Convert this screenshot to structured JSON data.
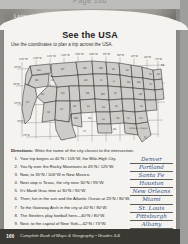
{
  "page": {
    "cutoff_text": "Page 166",
    "header_label": "Latitude and Longitude",
    "title": "See the USA",
    "subtitle": "Use the coordinates to plan a trip across the USA.",
    "directions_label": "Directions:",
    "directions_text": "Write the name of the city closest to the intersection."
  },
  "map": {
    "type": "united-states-political-map",
    "caption_longitude": [
      "125°W",
      "120°W",
      "115°W",
      "110°W",
      "105°W",
      "100°W",
      "95°W",
      "90°W",
      "85°W",
      "80°W",
      "75°W",
      "70°W"
    ],
    "caption_latitude": [
      "45°N",
      "40°N",
      "35°N",
      "30°N",
      "25°N"
    ],
    "labels": [
      "WA",
      "OR",
      "CA",
      "NV",
      "ID",
      "MT",
      "WY",
      "UT",
      "AZ",
      "NM",
      "CO",
      "ND",
      "SD",
      "NE",
      "KS",
      "OK",
      "TX",
      "MN",
      "IA",
      "MO",
      "AR",
      "LA",
      "WI",
      "IL",
      "MI",
      "IN",
      "OH",
      "KY",
      "TN",
      "MS",
      "AL",
      "GA",
      "FL",
      "SC",
      "NC",
      "VA",
      "WV",
      "PA",
      "NY",
      "ME",
      "MD"
    ],
    "ocean_label": "Atlantic Ocean"
  },
  "questions": [
    {
      "num": "1.",
      "text": "Your trip begins at 40°N / 105°W, the Mile-High City.",
      "answer": "Denver"
    },
    {
      "num": "2.",
      "text": "You fly over the Rocky Mountains to 45°N / 125°W.",
      "answer": "Portland"
    },
    {
      "num": "3.",
      "text": "Now, to 35°N / 106°W in New Mexico.",
      "answer": "Santa Fe"
    },
    {
      "num": "4.",
      "text": "Next stop is Texas, the city near 30°N / 95°W.",
      "answer": "Houston"
    },
    {
      "num": "5.",
      "text": "It's Mardi Gras time at 30°N / 90°W.",
      "answer": "New Orleans"
    },
    {
      "num": "6.",
      "text": "Then, fun in the sun and the Atlantic Ocean at 25°N / 80°W.",
      "answer": "Miami"
    },
    {
      "num": "7.",
      "text": "To the Gateway Arch in the city at 40°N / 90°W.",
      "answer": "St. Louis"
    },
    {
      "num": "8.",
      "text": "The Steelers play football here—40°N / 80°W.",
      "answer": "Pittsburgh"
    },
    {
      "num": "9.",
      "text": "Next, to the capital of New York—42°N / 73°W.",
      "answer": "Albany"
    }
  ],
  "footer": {
    "page_number": "166",
    "source": "Complete Book of Maps & Geography • Grades 3-6"
  },
  "colors": {
    "ink_blue": "#2f4f86",
    "paper": "#f4f3f0",
    "footer_bar": "#3a3833",
    "header_band": "#7e7b75"
  }
}
